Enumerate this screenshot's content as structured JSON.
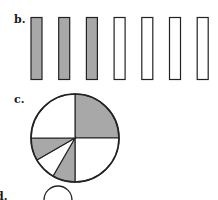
{
  "parts": {
    "b": {
      "label": "b.",
      "bars_total": 7,
      "bars_shaded": 3,
      "bar_states": [
        true,
        true,
        true,
        false,
        false,
        false,
        false
      ]
    },
    "c": {
      "label": "c.",
      "wedges": [
        {
          "start": 0,
          "end": 90,
          "shaded": true
        },
        {
          "start": 90,
          "end": 180,
          "shaded": false
        },
        {
          "start": 180,
          "end": 210,
          "shaded": true
        },
        {
          "start": 210,
          "end": 240,
          "shaded": false
        },
        {
          "start": 240,
          "end": 270,
          "shaded": true
        },
        {
          "start": 270,
          "end": 360,
          "shaded": false
        }
      ]
    },
    "d": {
      "label": "d."
    }
  },
  "colors": {
    "shade": "#a8a8a8",
    "outline": "#222222",
    "background": "#ffffff"
  },
  "chart_data": [
    {
      "type": "bar",
      "title": "b.",
      "categories": [
        "1",
        "2",
        "3",
        "4",
        "5",
        "6",
        "7"
      ],
      "values": [
        1,
        1,
        1,
        0,
        0,
        0,
        0
      ],
      "description": "7 equal bars, 3 shaded (3/7)"
    },
    {
      "type": "pie",
      "title": "c.",
      "slices_deg": [
        90,
        90,
        30,
        30,
        30,
        90
      ],
      "shaded": [
        true,
        false,
        true,
        false,
        true,
        false
      ],
      "description": "Circle divided into parts; shaded portions total 150 of 360 degrees (5/12)"
    }
  ]
}
